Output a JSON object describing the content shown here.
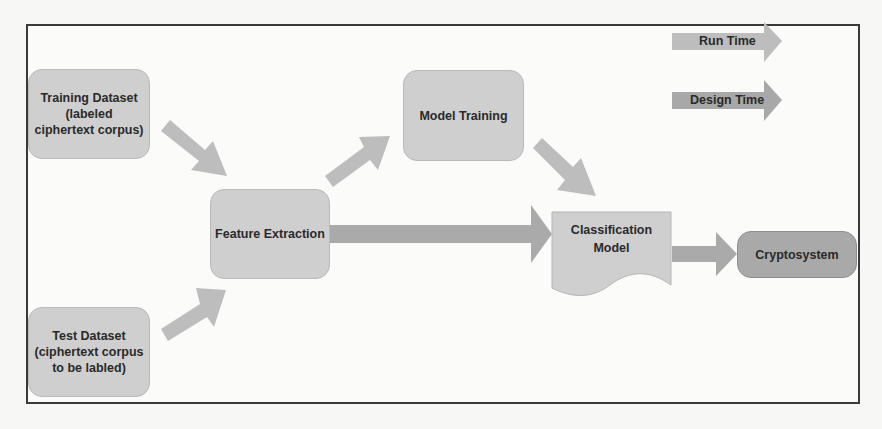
{
  "diagram": {
    "nodes": {
      "training_dataset": "Training Dataset (labeled ciphertext corpus)",
      "training_dataset_lines": [
        "Training Dataset",
        "(labeled",
        "ciphertext corpus)"
      ],
      "test_dataset": "Test Dataset (ciphertext corpus to be labled)",
      "test_dataset_lines": [
        "Test Dataset",
        "(ciphertext corpus",
        "to be labled)"
      ],
      "feature_extraction": "Feature Extraction",
      "model_training": "Model Training",
      "classification_model_lines": [
        "Classification",
        "Model"
      ],
      "cryptosystem": "Cryptosystem"
    },
    "legend": {
      "run_time": "Run Time",
      "design_time": "Design Time"
    },
    "edges": [
      {
        "from": "Training Dataset",
        "to": "Feature Extraction",
        "type": "design"
      },
      {
        "from": "Test Dataset",
        "to": "Feature Extraction",
        "type": "design"
      },
      {
        "from": "Feature Extraction",
        "to": "Model Training",
        "type": "design"
      },
      {
        "from": "Model Training",
        "to": "Classification Model",
        "type": "design"
      },
      {
        "from": "Feature Extraction",
        "to": "Classification Model",
        "type": "run"
      },
      {
        "from": "Classification Model",
        "to": "Cryptosystem",
        "type": "run"
      }
    ],
    "colors": {
      "node_fill": "#cfcfcf",
      "node_dark_fill": "#a9a9a9",
      "design_arrow": "#b8b8b8",
      "run_arrow": "#a8a8a8",
      "frame": "#3a3a3a"
    }
  }
}
